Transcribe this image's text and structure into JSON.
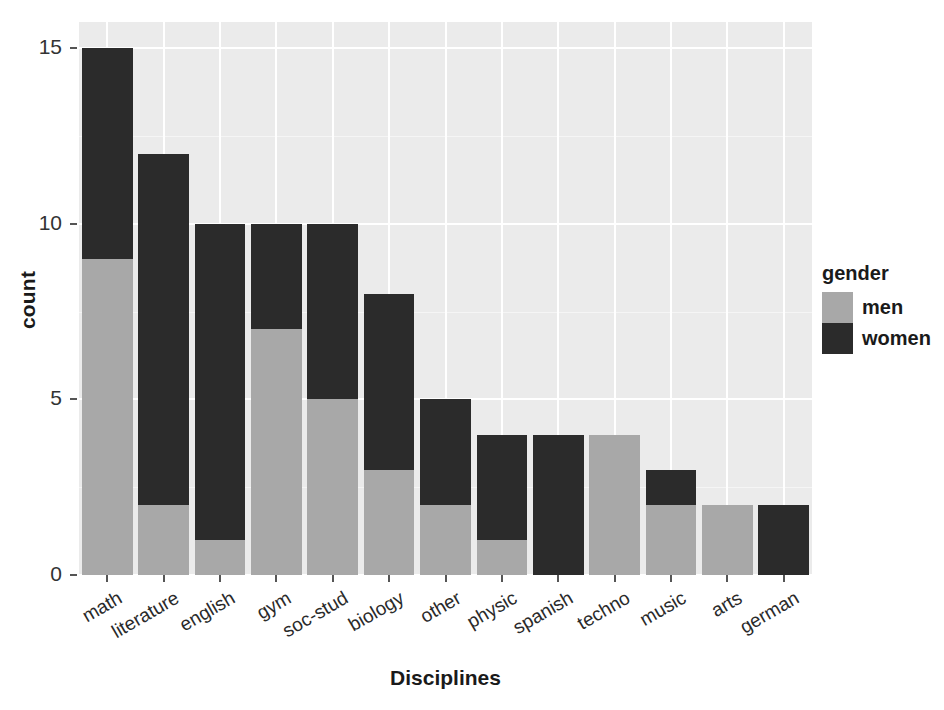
{
  "chart_data": {
    "type": "bar",
    "stacked": true,
    "title": "",
    "xlabel": "Disciplines",
    "ylabel": "count",
    "categories": [
      "math",
      "literature",
      "english",
      "gym",
      "soc-stud",
      "biology",
      "other",
      "physic",
      "spanish",
      "techno",
      "music",
      "arts",
      "german"
    ],
    "series": [
      {
        "name": "men",
        "values": [
          9,
          2,
          1,
          7,
          5,
          3,
          2,
          1,
          0,
          4,
          2,
          2,
          0
        ]
      },
      {
        "name": "women",
        "values": [
          6,
          10,
          9,
          3,
          5,
          5,
          3,
          3,
          4,
          0,
          1,
          0,
          2
        ]
      }
    ],
    "totals": [
      15,
      12,
      10,
      10,
      10,
      8,
      5,
      4,
      4,
      4,
      3,
      2,
      2
    ],
    "ylim": [
      0,
      15.75
    ],
    "yticks": [
      0,
      5,
      10,
      15
    ],
    "ytick_labels": [
      "0",
      "5",
      "10",
      "15"
    ],
    "grid": "white gridlines on grey panel",
    "legend": {
      "title": "gender",
      "position": "right",
      "entries": [
        {
          "label": "men",
          "color": "#a8a8a8"
        },
        {
          "label": "women",
          "color": "#2b2b2b"
        }
      ]
    },
    "colors": {
      "men": "#a8a8a8",
      "women": "#2b2b2b",
      "panel_background": "#ebebeb",
      "gridline": "#ffffff",
      "text": "#1a1a1a"
    }
  }
}
